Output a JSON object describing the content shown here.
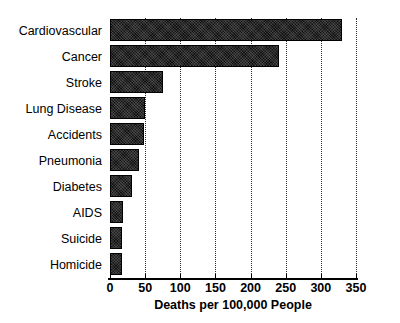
{
  "chart_data": {
    "type": "bar",
    "orientation": "horizontal",
    "title": "",
    "xlabel": "Deaths per 100,000 People",
    "ylabel": "",
    "categories": [
      "Cardiovascular",
      "Cancer",
      "Stroke",
      "Lung Disease",
      "Accidents",
      "Pneumonia",
      "Diabetes",
      "AIDS",
      "Suicide",
      "Homicide"
    ],
    "values": [
      330,
      240,
      75,
      50,
      48,
      41,
      31,
      19,
      17,
      17
    ],
    "xlim": [
      0,
      350
    ],
    "xticks": [
      0,
      50,
      100,
      150,
      200,
      250,
      300,
      350
    ],
    "xtick_labels": [
      "0",
      "50",
      "100",
      "150",
      "200",
      "250",
      "300",
      "350"
    ],
    "grid": "vertical-dotted",
    "legend": "none",
    "bar_color": "#111111"
  }
}
